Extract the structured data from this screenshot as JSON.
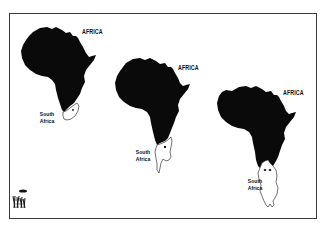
{
  "cartoon": {
    "panels": [
      {
        "continent_label": "AFRICA",
        "region_label_line1": "South",
        "region_label_line2": "Africa"
      },
      {
        "continent_label": "AFRICA",
        "region_label_line1": "South",
        "region_label_line2": "Africa"
      },
      {
        "continent_label": "AFRICA",
        "region_label_line1": "South",
        "region_label_line2": "Africa"
      }
    ],
    "signature": "artist-signature"
  },
  "colors": {
    "continent_fill": "#0a0a0a",
    "background": "#ffffff",
    "frame": "#3a3a3a"
  }
}
